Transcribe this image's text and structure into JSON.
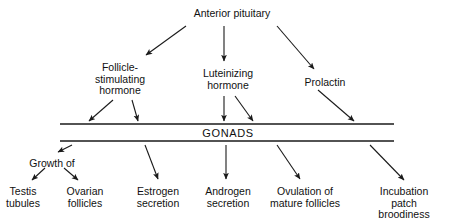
{
  "diagram": {
    "title_node": {
      "id": "anterior-pituitary",
      "label": "Anterior pituitary",
      "x": 232,
      "y": 8
    },
    "hormones": [
      {
        "id": "follicle-stimulating-hormone",
        "label": "Follicle-\nstimulating\nhormone",
        "x": 120,
        "y": 62
      },
      {
        "id": "luteinizing-hormone",
        "label": "Luteinizing\nhormone",
        "x": 228,
        "y": 68
      },
      {
        "id": "prolactin",
        "label": "Prolactin",
        "x": 325,
        "y": 77
      }
    ],
    "gonads": {
      "id": "gonads",
      "label": "GONADS",
      "x": 228,
      "y": 128,
      "bar_x1": 60,
      "bar_x2": 394,
      "bar_y_top": 124,
      "bar_y_bottom": 141
    },
    "intermediate": [
      {
        "id": "growth-of",
        "label": "Growth of",
        "x": 52,
        "y": 158
      }
    ],
    "outcomes": [
      {
        "id": "testis-tubules",
        "label": "Testis\ntubules",
        "x": 23,
        "y": 186
      },
      {
        "id": "ovarian-follicles",
        "label": "Ovarian\nfollicles",
        "x": 85,
        "y": 186
      },
      {
        "id": "estrogen-secretion",
        "label": "Estrogen\nsecretion",
        "x": 158,
        "y": 186
      },
      {
        "id": "androgen-secretion",
        "label": "Androgen\nsecretion",
        "x": 228,
        "y": 186
      },
      {
        "id": "ovulation-of-mature-follicles",
        "label": "Ovulation of\nmature follicles",
        "x": 305,
        "y": 186
      },
      {
        "id": "incubation-patch-broodiness",
        "label": "Incubation patch\nbroodiness",
        "x": 404,
        "y": 186
      }
    ],
    "arrows": [
      {
        "id": "arrow-pituitary-to-fsh",
        "from": "anterior-pituitary",
        "to": "follicle-stimulating-hormone",
        "x1": 186,
        "y1": 26,
        "x2": 146,
        "y2": 55
      },
      {
        "id": "arrow-pituitary-to-lh",
        "from": "anterior-pituitary",
        "to": "luteinizing-hormone",
        "x1": 224,
        "y1": 26,
        "x2": 224,
        "y2": 61
      },
      {
        "id": "arrow-pituitary-to-prolactin",
        "from": "anterior-pituitary",
        "to": "prolactin",
        "x1": 277,
        "y1": 26,
        "x2": 314,
        "y2": 69
      },
      {
        "id": "arrow-fsh-to-gonads-left",
        "from": "follicle-stimulating-hormone",
        "to": "gonads",
        "x1": 113,
        "y1": 100,
        "x2": 89,
        "y2": 121
      },
      {
        "id": "arrow-fsh-to-gonads-right",
        "from": "follicle-stimulating-hormone",
        "to": "gonads",
        "x1": 132,
        "y1": 100,
        "x2": 138,
        "y2": 121
      },
      {
        "id": "arrow-lh-to-gonads-center",
        "from": "luteinizing-hormone",
        "to": "gonads",
        "x1": 224,
        "y1": 96,
        "x2": 224,
        "y2": 121
      },
      {
        "id": "arrow-lh-to-gonads-right",
        "from": "luteinizing-hormone",
        "to": "gonads",
        "x1": 235,
        "y1": 96,
        "x2": 253,
        "y2": 121
      },
      {
        "id": "arrow-prolactin-to-gonads",
        "from": "prolactin",
        "to": "gonads",
        "x1": 318,
        "y1": 90,
        "x2": 354,
        "y2": 121
      },
      {
        "id": "arrow-gonads-to-growth-of",
        "from": "gonads",
        "to": "growth-of",
        "x1": 72,
        "y1": 145,
        "x2": 58,
        "y2": 152
      },
      {
        "id": "arrow-growth-of-to-testis-tubules",
        "from": "growth-of",
        "to": "testis-tubules",
        "x1": 45,
        "y1": 168,
        "x2": 32,
        "y2": 180
      },
      {
        "id": "arrow-growth-of-to-ovarian-follicles",
        "from": "growth-of",
        "to": "ovarian-follicles",
        "x1": 64,
        "y1": 168,
        "x2": 78,
        "y2": 180
      },
      {
        "id": "arrow-gonads-to-estrogen-secretion",
        "from": "gonads",
        "to": "estrogen-secretion",
        "x1": 145,
        "y1": 145,
        "x2": 158,
        "y2": 179
      },
      {
        "id": "arrow-gonads-to-androgen-secretion",
        "from": "gonads",
        "to": "androgen-secretion",
        "x1": 226,
        "y1": 145,
        "x2": 226,
        "y2": 179
      },
      {
        "id": "arrow-gonads-to-ovulation",
        "from": "gonads",
        "to": "ovulation-of-mature-follicles",
        "x1": 277,
        "y1": 145,
        "x2": 300,
        "y2": 179
      },
      {
        "id": "arrow-gonads-to-incubation-patch",
        "from": "gonads",
        "to": "incubation-patch-broodiness",
        "x1": 370,
        "y1": 145,
        "x2": 404,
        "y2": 180
      }
    ],
    "colors": {
      "stroke": "#1a1a1a",
      "text": "#111111",
      "background": "#ffffff"
    }
  }
}
